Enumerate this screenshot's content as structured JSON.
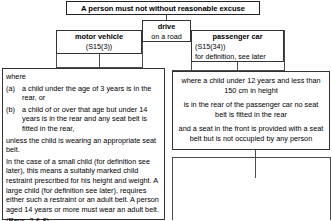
{
  "title": {
    "text": "A person must not without reasonable excuse"
  },
  "drive": {
    "heading": "drive",
    "sub": "on a road"
  },
  "motor_vehicle": {
    "heading": "motor vehicle",
    "sub": "(S15(3))"
  },
  "passenger_car": {
    "heading": "passenger car",
    "ref": "(S15(34))",
    "note": "for definition, see later"
  },
  "where_panel": {
    "lead": "where",
    "items": [
      {
        "marker": "(a)",
        "text": "a child under the age of 3 years is in the rear, or"
      },
      {
        "marker": "(b)",
        "text": "a child of or over that age but under 14 years is in the rear and any seat belt is fitted in the rear,"
      }
    ],
    "paragraphs": [
      "unless the child is wearing an appropriate seat belt.",
      "In the case of a small child (for definition see later), this means a suitably marked child restraint prescribed for his height and weight. A large child (for definition see later), requires either such a restraint or an adult belt.  A person aged 14 years or more must wear an adult belt.",
      "(Regs. 2 & 8)."
    ]
  },
  "right_panel": {
    "paragraphs": [
      "where a child under 12 years and less than 150 cm in height",
      "is in the rear of the passenger car no seat belt is fitted in the rear",
      "and a seat in the front is provided with a seat belt but is not occupied by any person"
    ]
  },
  "colors": {
    "border": "#333333",
    "connector": "#4a4a4a",
    "background": "#ffffff",
    "text": "#000000"
  }
}
